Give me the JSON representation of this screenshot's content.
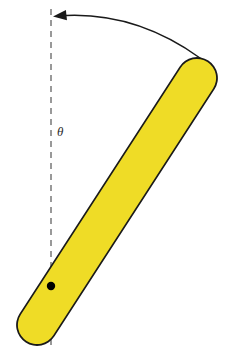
{
  "figure": {
    "canvas": {
      "width": 226,
      "height": 350,
      "background": "#ffffff"
    },
    "labels": {
      "angle_symbol": "θ"
    },
    "colors": {
      "rod_fill": "#EFDC26",
      "rod_outline": "#1a1a1a",
      "dashed_line": "#808080",
      "pivot_dot": "#000000",
      "arrow": "#1a1a1a",
      "label_text": "#2b2b2b",
      "background": "#ffffff"
    },
    "geometry": {
      "vertical_reference_line": {
        "x": 51,
        "y_start": 9,
        "y_end": 348,
        "dash_length": 6,
        "gap_length": 5,
        "stroke_width": 1.6
      },
      "rod": {
        "pivot_end": {
          "x": 37,
          "y": 325
        },
        "free_end": {
          "x": 197,
          "y": 78
        },
        "half_width": 20,
        "cap_style": "round",
        "stroke_width": 1.8,
        "angle_from_vertical_deg": 33
      },
      "pivot_dot": {
        "x": 51,
        "y": 286,
        "radius": 4.2
      },
      "angle_arc_arrow": {
        "start": {
          "x": 200,
          "y": 58
        },
        "control": {
          "x": 133,
          "y": 10
        },
        "end": {
          "x": 58,
          "y": 16
        },
        "arrow_tip": {
          "x": 53,
          "y": 16.5
        },
        "stroke_width": 1.5,
        "direction": "counterclockwise-toward-vertical"
      },
      "angle_label_position": {
        "x": 57,
        "y": 125
      }
    }
  }
}
